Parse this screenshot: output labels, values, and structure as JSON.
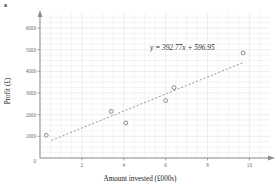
{
  "corner_tag": "a",
  "chart_data": {
    "type": "scatter",
    "title": "",
    "xlabel": "Amount invested (£000s)",
    "ylabel": "Profit (£)",
    "xlim": [
      0,
      10.6
    ],
    "ylim": [
      0,
      6600
    ],
    "xticks": [
      0,
      2,
      4,
      6,
      8,
      10
    ],
    "xticklabels": [
      "0",
      "2",
      "4",
      "6",
      "8",
      "10"
    ],
    "yticks": [
      0,
      1000,
      2000,
      3000,
      4000,
      5000,
      6000
    ],
    "yticklabels": [
      "0",
      "1000",
      "2000",
      "3000",
      "4000",
      "5000",
      "6000"
    ],
    "grid": true,
    "legend": null,
    "points": [
      {
        "x": 0.3,
        "y": 1050
      },
      {
        "x": 3.4,
        "y": 2150
      },
      {
        "x": 4.1,
        "y": 1620
      },
      {
        "x": 6.0,
        "y": 2650
      },
      {
        "x": 6.4,
        "y": 3250
      },
      {
        "x": 9.7,
        "y": 4850
      }
    ],
    "trendline": {
      "style": "dashed",
      "slope": 392.77,
      "intercept": 596.95,
      "x_start": 0.55,
      "x_end": 9.75,
      "equation": "y = 392.77x + 596.95"
    },
    "colors": {
      "marker": "#8a8a8a",
      "trendline": "#8a8a8a",
      "grid": "#e8e8ec",
      "axis": "#8d8d8d",
      "text": "#1a1a1a",
      "tick_text": "#6d6d6d"
    }
  }
}
